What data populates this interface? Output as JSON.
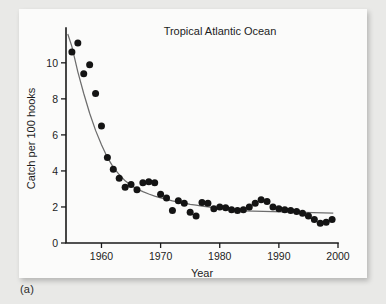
{
  "figure": {
    "caption": "(a)",
    "background_color": "#e9e9e7",
    "card_color": "#fbfbfa"
  },
  "chart_data": {
    "type": "scatter",
    "title": "Tropical Atlantic Ocean",
    "xlabel": "Year",
    "ylabel": "Catch per 100  hooks",
    "xlim": [
      1954,
      2000
    ],
    "ylim": [
      0,
      11.6
    ],
    "xticks": [
      1960,
      1970,
      1980,
      1990,
      2000
    ],
    "yticks": [
      0,
      2,
      4,
      6,
      8,
      10
    ],
    "grid": false,
    "legend": "none",
    "marker_color": "#141414",
    "fit_color": "#6d6d6d",
    "series": [
      {
        "name": "Catch per 100 hooks",
        "x": [
          1955,
          1956,
          1957,
          1958,
          1959,
          1960,
          1961,
          1962,
          1963,
          1964,
          1965,
          1966,
          1967,
          1968,
          1969,
          1970,
          1971,
          1972,
          1973,
          1974,
          1975,
          1976,
          1977,
          1978,
          1979,
          1980,
          1981,
          1982,
          1983,
          1984,
          1985,
          1986,
          1987,
          1988,
          1989,
          1990,
          1991,
          1992,
          1993,
          1994,
          1995,
          1996,
          1997,
          1998,
          1999
        ],
        "values": [
          10.6,
          11.1,
          9.4,
          9.9,
          8.3,
          6.5,
          4.75,
          4.1,
          3.6,
          3.1,
          3.25,
          2.95,
          3.35,
          3.4,
          3.35,
          2.7,
          2.5,
          1.8,
          2.35,
          2.2,
          1.7,
          1.5,
          2.25,
          2.2,
          1.9,
          2.0,
          1.95,
          1.85,
          1.8,
          1.85,
          2.0,
          2.2,
          2.4,
          2.3,
          2.0,
          1.9,
          1.85,
          1.8,
          1.75,
          1.65,
          1.5,
          1.3,
          1.1,
          1.15,
          1.3
        ]
      }
    ],
    "fit_curves": [
      {
        "name": "exponential-decline-fit",
        "x": [
          1954.3,
          1955,
          1956,
          1957,
          1958,
          1959,
          1960,
          1961,
          1962,
          1963,
          1964,
          1965,
          1966,
          1967,
          1968,
          1969,
          1970,
          1971,
          1972,
          1973,
          1974,
          1975,
          1976,
          1977,
          1978,
          1979,
          1980,
          1981,
          1982,
          1983,
          1984
        ],
        "values": [
          11.6,
          10.9,
          9.5,
          8.3,
          7.2,
          6.25,
          5.45,
          4.75,
          4.2,
          3.8,
          3.45,
          3.2,
          3.0,
          2.85,
          2.72,
          2.6,
          2.5,
          2.42,
          2.34,
          2.27,
          2.21,
          2.15,
          2.1,
          2.05,
          2.0,
          1.96,
          1.92,
          1.89,
          1.86,
          1.83,
          1.8
        ]
      },
      {
        "name": "flat-baseline-fit",
        "x": [
          1984,
          1999.2
        ],
        "values": [
          1.78,
          1.66
        ]
      }
    ]
  }
}
